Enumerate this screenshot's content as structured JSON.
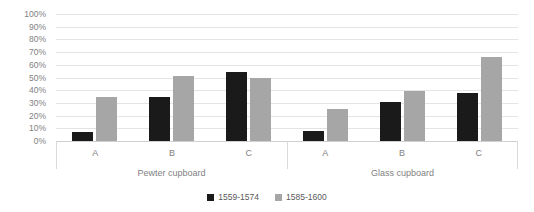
{
  "chart_data": {
    "type": "bar",
    "title": "",
    "subtitle": "",
    "xlabel": "",
    "ylabel": "",
    "ylim": [
      0,
      100
    ],
    "y_tick_labels": [
      "100%",
      "90%",
      "80%",
      "70%",
      "60%",
      "50%",
      "40%",
      "30%",
      "20%",
      "10%",
      "0%"
    ],
    "y_tick_values": [
      100,
      90,
      80,
      70,
      60,
      50,
      40,
      30,
      20,
      10,
      0
    ],
    "grid": true,
    "legend_position": "bottom",
    "categories": [
      "A",
      "B",
      "C"
    ],
    "panels": [
      {
        "name": "Pewter cupboard",
        "categories": [
          "A",
          "B",
          "C"
        ],
        "series": [
          {
            "name": "1559-1574",
            "color": "#1a1a1a",
            "values": [
              7,
              35,
              54
            ]
          },
          {
            "name": "1585-1600",
            "color": "#a6a6a6",
            "values": [
              35,
              51,
              50
            ]
          }
        ]
      },
      {
        "name": "Glass cupboard",
        "categories": [
          "A",
          "B",
          "C"
        ],
        "series": [
          {
            "name": "1559-1574",
            "color": "#1a1a1a",
            "values": [
              8,
              31,
              38
            ]
          },
          {
            "name": "1585-1600",
            "color": "#a6a6a6",
            "values": [
              25,
              39,
              66
            ]
          }
        ]
      }
    ],
    "legend": [
      {
        "label": "1559-1574",
        "color": "#1a1a1a"
      },
      {
        "label": "1585-1600",
        "color": "#a6a6a6"
      }
    ]
  }
}
